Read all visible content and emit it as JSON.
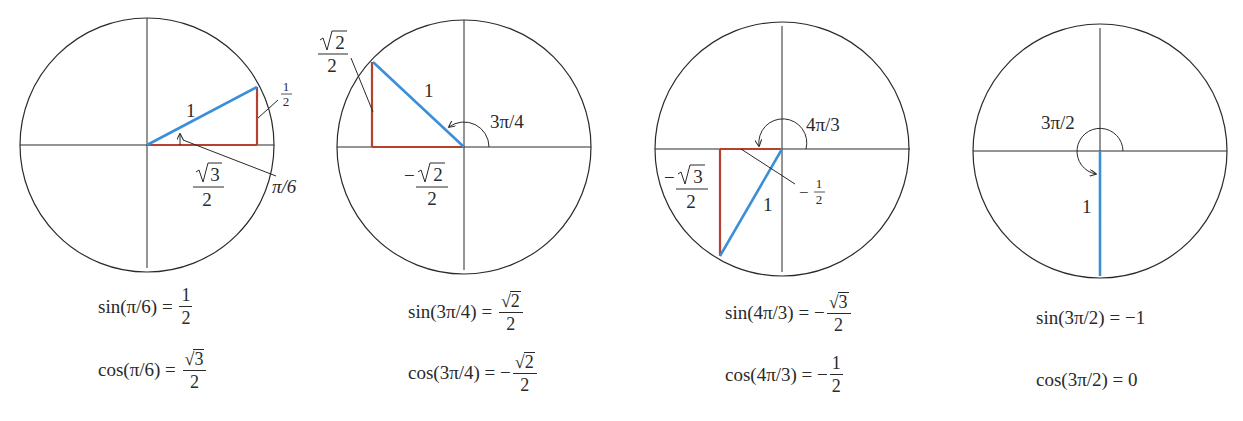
{
  "colors": {
    "circle": "#2a2a2a",
    "axis": "#2a2a2a",
    "hypotenuse": "#3b8fd8",
    "legs": "#b5412e",
    "text": "#2a2a2a"
  },
  "panels": [
    {
      "angle_label": "π/6",
      "hypotenuse_label": "1",
      "opposite_label": {
        "num": "1",
        "den": "2"
      },
      "adjacent_label": {
        "num": "√3",
        "num_radicand": "3",
        "den": "2",
        "sign": ""
      },
      "equations": {
        "sin": {
          "lhs": "sin(π/6) =",
          "sign": "",
          "num": "1",
          "radicand": "",
          "den": "2"
        },
        "cos": {
          "lhs": "cos(π/6) =",
          "sign": "",
          "num": "",
          "radicand": "3",
          "den": "2"
        }
      }
    },
    {
      "angle_label": "3π/4",
      "hypotenuse_label": "1",
      "opposite_label": {
        "radicand": "2",
        "den": "2"
      },
      "adjacent_label": {
        "sign": "−",
        "radicand": "2",
        "den": "2"
      },
      "equations": {
        "sin": {
          "lhs": "sin(3π/4) =",
          "sign": "",
          "radicand": "2",
          "den": "2"
        },
        "cos": {
          "lhs": "cos(3π/4) =",
          "sign": "−",
          "radicand": "2",
          "den": "2"
        }
      }
    },
    {
      "angle_label": "4π/3",
      "hypotenuse_label": "1",
      "opposite_label": {
        "sign": "−",
        "radicand": "3",
        "den": "2"
      },
      "adjacent_label": {
        "sign": "−",
        "num": "1",
        "den": "2"
      },
      "equations": {
        "sin": {
          "lhs": "sin(4π/3) =",
          "sign": "−",
          "radicand": "3",
          "den": "2"
        },
        "cos": {
          "lhs": "cos(4π/3) =",
          "sign": "−",
          "num": "1",
          "den": "2"
        }
      }
    },
    {
      "angle_label": "3π/2",
      "hypotenuse_label": "1",
      "equations": {
        "sin": {
          "lhs": "sin(3π/2) =",
          "value": "−1"
        },
        "cos": {
          "lhs": "cos(3π/2) =",
          "value": "0"
        }
      }
    }
  ]
}
